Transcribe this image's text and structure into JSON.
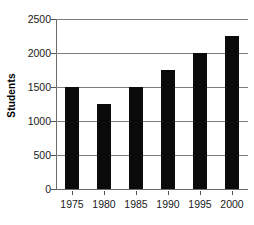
{
  "chart_data": {
    "type": "bar",
    "title": "",
    "xlabel": "",
    "ylabel": "Students",
    "categories": [
      "1975",
      "1980",
      "1985",
      "1990",
      "1995",
      "2000"
    ],
    "values": [
      1500,
      1250,
      1500,
      1750,
      2000,
      2250
    ],
    "ylim": [
      0,
      2500
    ],
    "yticks": [
      0,
      500,
      1000,
      1500,
      2000,
      2500
    ],
    "ytick_labels": [
      "0",
      "500",
      "1000",
      "1500",
      "2000",
      "2500"
    ],
    "grid": true,
    "legend": false,
    "bar_color": "#0a0a0a",
    "gridline_color": "#7d7d7d",
    "axis_color": "#6b6b6b",
    "background_color": "#ffffff"
  }
}
